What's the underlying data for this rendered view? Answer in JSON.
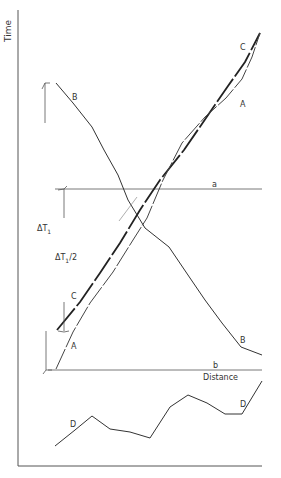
{
  "labels": {
    "y_axis": "Time",
    "x_axis": "Distance",
    "line_a": "a",
    "line_b": "b",
    "curve_a_top": "A",
    "curve_a_bottom": "A",
    "curve_b_top": "B",
    "curve_b_bottom": "B",
    "curve_c_top": "C",
    "curve_c_bottom": "C",
    "curve_d_left": "D",
    "curve_d_right": "D",
    "delta_t1": "ΔT",
    "delta_t1_sub": "1",
    "delta_t1_half": "ΔT",
    "delta_t1_half_sub": "1",
    "delta_t1_half_suffix": "/2"
  }
}
